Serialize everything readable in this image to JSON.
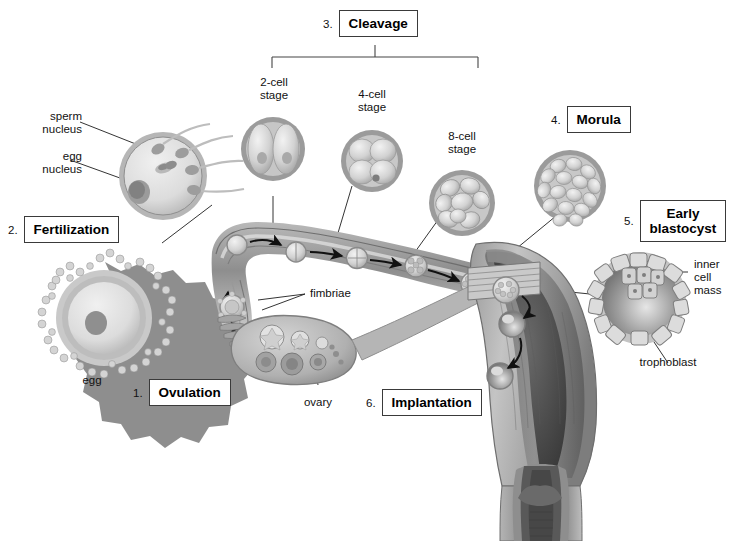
{
  "diagram": {
    "title_steps": [
      {
        "id": "ovulation",
        "number": "1.",
        "label": "Ovulation"
      },
      {
        "id": "fertilization",
        "number": "2.",
        "label": "Fertilization"
      },
      {
        "id": "cleavage",
        "number": "3.",
        "label": "Cleavage"
      },
      {
        "id": "morula",
        "number": "4.",
        "label": "Morula"
      },
      {
        "id": "early-blastocyst",
        "number": "5.",
        "label": "Early\nblastocyst"
      },
      {
        "id": "implantation",
        "number": "6.",
        "label": "Implantation"
      }
    ],
    "stage_labels": [
      {
        "id": "two-cell",
        "text": "2-cell\nstage"
      },
      {
        "id": "four-cell",
        "text": "4-cell\nstage"
      },
      {
        "id": "eight-cell",
        "text": "8-cell\nstage"
      }
    ],
    "part_labels": [
      {
        "id": "sperm-nucleus",
        "text": "sperm\nnucleus"
      },
      {
        "id": "egg-nucleus",
        "text": "egg\nnucleus"
      },
      {
        "id": "egg",
        "text": "egg"
      },
      {
        "id": "fimbriae",
        "text": "fimbriae"
      },
      {
        "id": "ovary",
        "text": "ovary"
      },
      {
        "id": "inner-cell-mass",
        "text": "inner\ncell\nmass"
      },
      {
        "id": "trophoblast",
        "text": "trophoblast"
      }
    ],
    "colors": {
      "line": "#1d1d1d",
      "box_border": "#3a3a3a",
      "tissue_light": "#cfcfcf",
      "tissue_mid": "#a8a8a8",
      "tissue_dark": "#6f6f6f",
      "tissue_darkest": "#4a4a4a",
      "cell_fill": "#d8d8d8",
      "zona": "#9a9a9a",
      "background": "#ffffff"
    }
  }
}
